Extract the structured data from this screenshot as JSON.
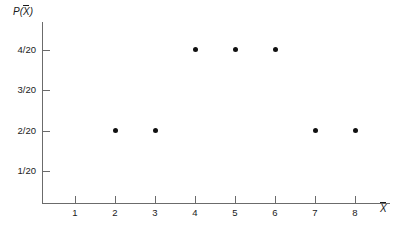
{
  "chart_data": {
    "type": "scatter",
    "title": "",
    "xlabel": "X̄",
    "ylabel": "P(X̄)",
    "xlabel_parts": {
      "prefix": "",
      "bar_var": "X"
    },
    "ylabel_parts": {
      "prefix": "P(",
      "bar_var": "X",
      "suffix": ")"
    },
    "grid": false,
    "legend": null,
    "xlim": [
      0.2,
      8.8
    ],
    "ylim": [
      0,
      4.55
    ],
    "x_ticks": [
      1,
      2,
      3,
      4,
      5,
      6,
      7,
      8
    ],
    "x_tick_labels": [
      "1",
      "2",
      "3",
      "4",
      "5",
      "6",
      "7",
      "8"
    ],
    "y_ticks": [
      1,
      2,
      3,
      4
    ],
    "y_tick_labels": [
      "1/20",
      "2/20",
      "3/20",
      "4/20"
    ],
    "points": [
      {
        "x": 2,
        "y": 2,
        "x_label": "2",
        "y_label": "2/20"
      },
      {
        "x": 3,
        "y": 2,
        "x_label": "3",
        "y_label": "2/20"
      },
      {
        "x": 4,
        "y": 4,
        "x_label": "4",
        "y_label": "4/20"
      },
      {
        "x": 5,
        "y": 4,
        "x_label": "5",
        "y_label": "4/20"
      },
      {
        "x": 6,
        "y": 4,
        "x_label": "6",
        "y_label": "4/20"
      },
      {
        "x": 7,
        "y": 2,
        "x_label": "7",
        "y_label": "2/20"
      },
      {
        "x": 8,
        "y": 2,
        "x_label": "8",
        "y_label": "2/20"
      }
    ],
    "colors": {
      "point": "#111111",
      "axis": "#6b6b6b",
      "text": "#1a1a1a",
      "background": "#ffffff"
    }
  }
}
